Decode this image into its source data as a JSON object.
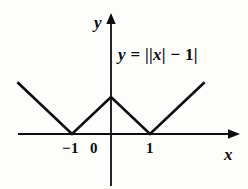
{
  "figure": {
    "background_color": "#fdfdfb",
    "ink_color": "#0d0d0d",
    "width": 248,
    "height": 189
  },
  "axes": {
    "x_axis_label": "x",
    "y_axis_label": "y",
    "origin_label": "0",
    "x_ticks": [
      {
        "label": "−1",
        "value": -1
      },
      {
        "label": "0",
        "value": 0
      },
      {
        "label": "1",
        "value": 1
      }
    ]
  },
  "equation": {
    "lhs": "y",
    "equals": " = ",
    "rhs_open": "||",
    "rhs_var": "x",
    "rhs_mid": "| − 1|",
    "full_text": "y = ||x| − 1|"
  },
  "chart_data": {
    "type": "line",
    "title": "",
    "subtitle": "",
    "xlabel": "x",
    "ylabel": "y",
    "function": "y = ||x| - 1|",
    "grid": false,
    "legend": null,
    "xlim": [
      -2.4,
      3.1
    ],
    "ylim": [
      -1.3,
      3.0
    ],
    "x_ticks": [
      -1,
      0,
      1
    ],
    "x_tick_labels": [
      "−1",
      "0",
      "1"
    ],
    "y_ticks": [],
    "y_tick_labels": [],
    "series": [
      {
        "name": "y = ||x| - 1|",
        "color": "#0d0d0d",
        "x": [
          -2.4,
          -1,
          0,
          1,
          2.4
        ],
        "values": [
          1.4,
          0,
          1,
          0,
          1.4
        ],
        "vertices": [
          {
            "x": -2.4,
            "y": 1.4,
            "kind": "endpoint"
          },
          {
            "x": -1,
            "y": 0,
            "kind": "minimum"
          },
          {
            "x": 0,
            "y": 1,
            "kind": "local-maximum"
          },
          {
            "x": 1,
            "y": 0,
            "kind": "minimum"
          },
          {
            "x": 2.4,
            "y": 1.4,
            "kind": "endpoint"
          }
        ]
      }
    ],
    "annotations": [
      {
        "text": "y = ||x| − 1|",
        "x": 0.25,
        "y": 2.0
      }
    ]
  }
}
